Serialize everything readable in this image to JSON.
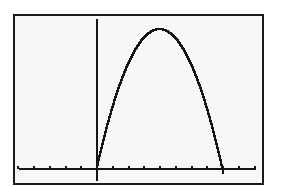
{
  "chart_data": {
    "type": "line",
    "title": "",
    "xlabel": "",
    "ylabel": "",
    "function": "y = x(8 - x)",
    "x": [
      0,
      0.5,
      1,
      1.5,
      2,
      2.5,
      3,
      3.5,
      4,
      4.5,
      5,
      5.5,
      6,
      6.5,
      7,
      7.5,
      8
    ],
    "series": [
      {
        "name": "Y1",
        "values": [
          0,
          3.75,
          7,
          9.75,
          12,
          13.75,
          15,
          15.75,
          16,
          15.75,
          15,
          13.75,
          12,
          9.75,
          7,
          3.75,
          0
        ]
      }
    ],
    "xlim": [
      -5,
      10
    ],
    "ylim": [
      -1.6,
      17.1
    ],
    "x_tick_spacing": 1,
    "x_ticks": [
      -5,
      -4,
      -3,
      -2,
      -1,
      0,
      1,
      2,
      3,
      4,
      5,
      6,
      7,
      8,
      9,
      10
    ],
    "y_ticks": [],
    "grid": false,
    "legend": "none",
    "vertex": [
      4,
      16
    ],
    "roots": [
      0,
      8
    ]
  },
  "style": {
    "screen_bg": "#f8f8f8",
    "line_color": "#151515",
    "border_color": "#1a1a1a"
  },
  "layout": {
    "x_axis_pixel_y": 169,
    "y_axis_pixel_x": 97,
    "x_axis_start_px": 19,
    "x_axis_end_px": 256,
    "y_axis_top_px": 19,
    "px_per_x_unit": 15.75,
    "px_per_y_unit": 8.75,
    "tick_height_px": 3
  }
}
